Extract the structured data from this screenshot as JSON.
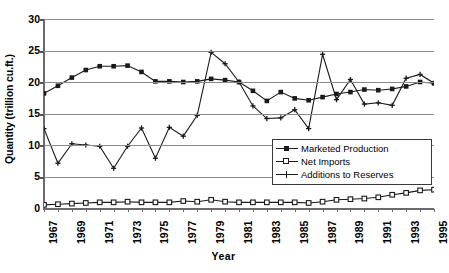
{
  "chart_data": {
    "type": "line",
    "title": "",
    "xlabel": "Year",
    "ylabel": "Quantity (trillion cu.ft.)",
    "ylim": [
      0,
      30
    ],
    "yticks": [
      0,
      5,
      10,
      15,
      20,
      25,
      30
    ],
    "ytick_labels": [
      "0",
      "5",
      "10",
      "15",
      "20",
      "25",
      "30"
    ],
    "grid": true,
    "legend_position": "center-right",
    "x": [
      1967,
      1968,
      1969,
      1970,
      1971,
      1972,
      1973,
      1974,
      1975,
      1976,
      1977,
      1978,
      1979,
      1980,
      1981,
      1982,
      1983,
      1984,
      1985,
      1986,
      1987,
      1988,
      1989,
      1990,
      1991,
      1992,
      1993,
      1994,
      1995
    ],
    "xtick_labels": [
      "1967",
      "1969",
      "1971",
      "1973",
      "1975",
      "1977",
      "1979",
      "1981",
      "1983",
      "1985",
      "1987",
      "1989",
      "1991",
      "1993",
      "1995"
    ],
    "xtick_values": [
      1967,
      1969,
      1971,
      1973,
      1975,
      1977,
      1979,
      1981,
      1983,
      1985,
      1987,
      1989,
      1991,
      1993,
      1995
    ],
    "series": [
      {
        "name": "Marketed Production",
        "marker": "filled-square",
        "values": [
          18.2,
          19.4,
          20.7,
          21.9,
          22.5,
          22.5,
          22.6,
          21.6,
          20.1,
          20.1,
          20.0,
          20.1,
          20.5,
          20.3,
          20.0,
          18.6,
          17.0,
          18.4,
          17.4,
          17.1,
          17.6,
          18.1,
          18.4,
          18.8,
          18.7,
          18.9,
          19.3,
          20.0,
          19.8
        ]
      },
      {
        "name": "Net Imports",
        "marker": "open-square",
        "values": [
          0.5,
          0.6,
          0.7,
          0.8,
          0.9,
          0.9,
          1.0,
          0.9,
          0.9,
          0.9,
          1.1,
          1.0,
          1.3,
          1.0,
          0.9,
          0.9,
          0.9,
          0.9,
          0.9,
          0.8,
          1.0,
          1.3,
          1.4,
          1.5,
          1.7,
          2.1,
          2.4,
          2.8,
          2.9
        ]
      },
      {
        "name": "Additions to Reserves",
        "marker": "cross",
        "values": [
          12.6,
          7.1,
          10.2,
          10.0,
          9.8,
          6.3,
          9.8,
          12.7,
          7.9,
          12.8,
          11.4,
          14.7,
          24.7,
          22.9,
          20.0,
          16.2,
          14.2,
          14.3,
          15.6,
          12.6,
          24.4,
          17.2,
          20.4,
          16.5,
          16.7,
          16.3,
          20.6,
          21.2,
          19.8
        ]
      }
    ]
  },
  "legend": {
    "items": [
      {
        "label": "Marketed Production",
        "marker": "filled-square"
      },
      {
        "label": "Net Imports",
        "marker": "open-square"
      },
      {
        "label": "Additions to Reserves",
        "marker": "cross"
      }
    ]
  }
}
